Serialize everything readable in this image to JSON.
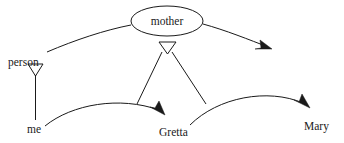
{
  "diagram": {
    "background_color": "#ffffff",
    "line_color": "#1a1a1a",
    "nodes": {
      "mother": {
        "label": "mother",
        "shape": "ellipse",
        "cx": 167,
        "cy": 21,
        "rx": 36,
        "ry": 15
      },
      "person": {
        "label": "person",
        "shape": "text",
        "x": 8,
        "y": 66
      },
      "me": {
        "label": "me",
        "shape": "text",
        "x": 27,
        "y": 133
      },
      "gretta": {
        "label": "Gretta",
        "shape": "text",
        "x": 159,
        "y": 136
      },
      "mary": {
        "label": "Mary",
        "shape": "text",
        "x": 304,
        "y": 130
      }
    },
    "markers": {
      "hollow_triangle_person": {
        "name": "person-instance-triangle",
        "cx": 35,
        "cy": 70
      },
      "hollow_triangle_mother": {
        "name": "mother-instance-triangle",
        "cx": 167,
        "cy": 49
      },
      "solid_arrow_top_right": {
        "name": "mother-to-mary-arrowhead",
        "x": 272,
        "y": 49
      },
      "solid_arrow_gretta": {
        "name": "me-to-gretta-arrowhead",
        "x": 164,
        "y": 113
      },
      "solid_arrow_mary": {
        "name": "gretta-to-mary-arrowhead",
        "x": 309,
        "y": 106
      }
    },
    "edges": [
      {
        "name": "person-to-mother-curve",
        "from": "person",
        "to": "mother",
        "style": "curve",
        "arrow": "none"
      },
      {
        "name": "mother-to-right-arrow-curve",
        "from": "mother",
        "to": "mary-arrow",
        "style": "curve",
        "arrow": "solid"
      },
      {
        "name": "person-instantiation-line",
        "from": "person-triangle",
        "to": "me",
        "style": "straight",
        "arrow": "hollow-triangle"
      },
      {
        "name": "mother-instantiation-left",
        "from": "mother-triangle",
        "to": "me-gretta-link",
        "style": "straight",
        "arrow": "hollow-triangle"
      },
      {
        "name": "mother-instantiation-right",
        "from": "mother-triangle",
        "to": "gretta-mary-link",
        "style": "straight",
        "arrow": "hollow-triangle"
      },
      {
        "name": "me-to-gretta-curve",
        "from": "me",
        "to": "gretta",
        "style": "curve",
        "arrow": "solid"
      },
      {
        "name": "gretta-to-mary-curve",
        "from": "gretta",
        "to": "mary",
        "style": "curve",
        "arrow": "solid"
      }
    ]
  }
}
